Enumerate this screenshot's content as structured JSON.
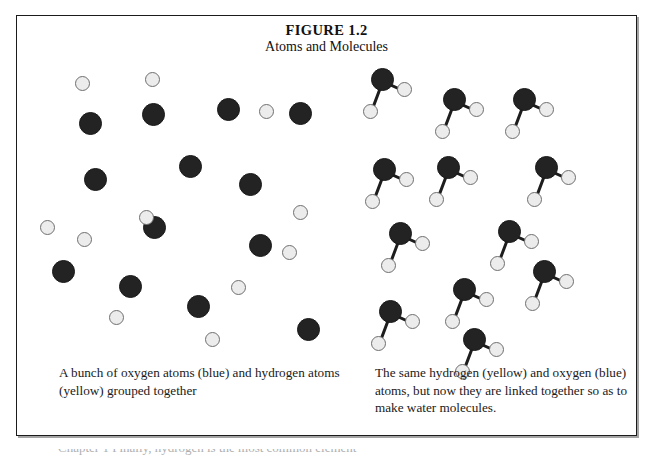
{
  "figure": {
    "title": "FIGURE 1.2",
    "subtitle": "Atoms and Molecules",
    "caption_left": "A bunch of oxygen atoms (blue) and hydrogen atoms (yellow) grouped together",
    "caption_right": "The same hydrogen (yellow) and oxygen (blue) atoms, but now they are linked together so as to make water molecules.",
    "footer_clipped_text": "Chapter 1 Finally, hydrogen is the most common element"
  },
  "legend": {
    "oxygen_label": "oxygen (blue)",
    "hydrogen_label": "hydrogen (yellow)",
    "oxygen_color": "#232323",
    "hydrogen_color": "#ececec",
    "bond_color": "#1d1d1d",
    "frame_color": "#1b1b1b"
  },
  "scene_left": {
    "description": "loose unbonded atoms",
    "oxygen_atoms": [
      {
        "x": 52,
        "y": 52
      },
      {
        "x": 115,
        "y": 43
      },
      {
        "x": 190,
        "y": 38
      },
      {
        "x": 262,
        "y": 42
      },
      {
        "x": 57,
        "y": 108
      },
      {
        "x": 152,
        "y": 95
      },
      {
        "x": 222,
        "y": 174
      },
      {
        "x": 116,
        "y": 156
      },
      {
        "x": 212,
        "y": 113
      },
      {
        "x": 25,
        "y": 200
      },
      {
        "x": 92,
        "y": 215
      },
      {
        "x": 160,
        "y": 235
      },
      {
        "x": 270,
        "y": 258
      }
    ],
    "hydrogen_atoms": [
      {
        "x": 48,
        "y": 16
      },
      {
        "x": 118,
        "y": 12
      },
      {
        "x": 232,
        "y": 44
      },
      {
        "x": 13,
        "y": 160
      },
      {
        "x": 112,
        "y": 150
      },
      {
        "x": 50,
        "y": 172
      },
      {
        "x": 255,
        "y": 185
      },
      {
        "x": 266,
        "y": 145
      },
      {
        "x": 204,
        "y": 220
      },
      {
        "x": 82,
        "y": 250
      },
      {
        "x": 178,
        "y": 272
      }
    ]
  },
  "scene_right": {
    "description": "water molecules, each oxygen bonded to two hydrogens",
    "molecules": [
      {
        "ox": 28,
        "oy": 8
      },
      {
        "ox": 100,
        "oy": 28
      },
      {
        "ox": 170,
        "oy": 28
      },
      {
        "ox": 30,
        "oy": 98
      },
      {
        "ox": 94,
        "oy": 96
      },
      {
        "ox": 192,
        "oy": 96
      },
      {
        "ox": 46,
        "oy": 162
      },
      {
        "ox": 155,
        "oy": 160
      },
      {
        "ox": 110,
        "oy": 218
      },
      {
        "ox": 190,
        "oy": 200
      },
      {
        "ox": 36,
        "oy": 240
      },
      {
        "ox": 120,
        "oy": 268
      }
    ],
    "bond_h1": {
      "dx": 26,
      "dy": 14,
      "len": 30
    },
    "bond_h2": {
      "dx": -8,
      "dy": 36,
      "len": 38
    }
  }
}
